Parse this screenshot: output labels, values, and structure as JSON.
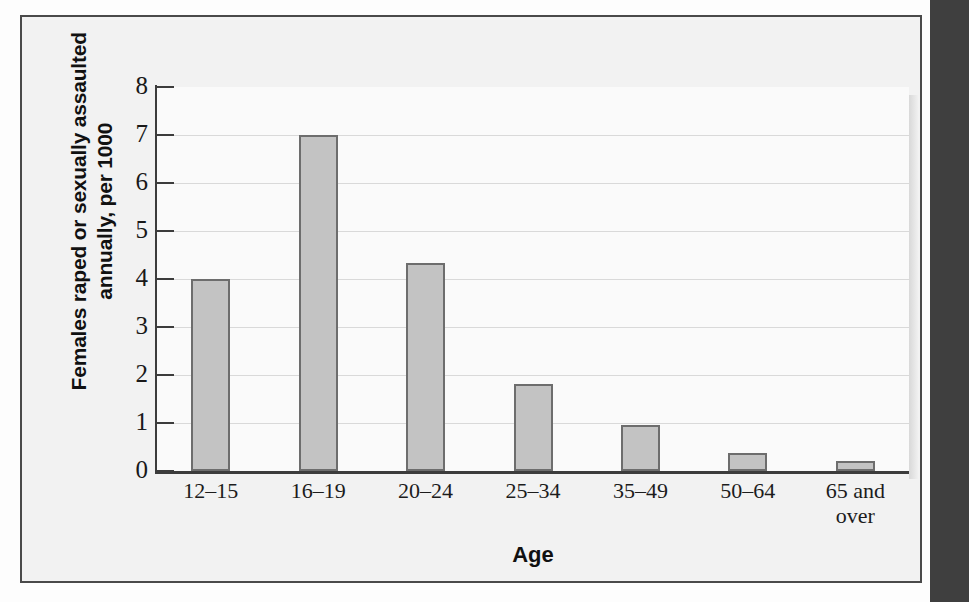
{
  "figure": {
    "frame_color": "#4a4a4a",
    "plot_background": "#fafafa",
    "bar_fill": "#c3c3c3",
    "bar_border": "#6d6d6d",
    "gridline_color": "#d9d9d9",
    "right_band_color": "#3f3f3f"
  },
  "chart_data": {
    "type": "bar",
    "title": "",
    "xlabel": "Age",
    "ylabel": "Females raped or sexually assaulted annually, per 1000",
    "ylabel_lines": [
      "Females raped or sexually assaulted",
      "annually, per 1000"
    ],
    "categories": [
      "12–15",
      "16–19",
      "20–24",
      "25–34",
      "35–49",
      "50–64",
      "65 and over"
    ],
    "category_lines": [
      [
        "12–15"
      ],
      [
        "16–19"
      ],
      [
        "20–24"
      ],
      [
        "25–34"
      ],
      [
        "35–49"
      ],
      [
        "50–64"
      ],
      [
        "65 and",
        "over"
      ]
    ],
    "values": [
      4.0,
      7.0,
      4.33,
      1.82,
      0.95,
      0.37,
      0.2
    ],
    "ylim": [
      0,
      8
    ],
    "ytick_labels": [
      "8",
      "7",
      "6",
      "5",
      "4",
      "3",
      "2",
      "1",
      "0"
    ],
    "ytick_values": [
      8,
      7,
      6,
      5,
      4,
      3,
      2,
      1,
      0
    ],
    "grid": true,
    "grid_axis": "y",
    "legend": "none"
  }
}
